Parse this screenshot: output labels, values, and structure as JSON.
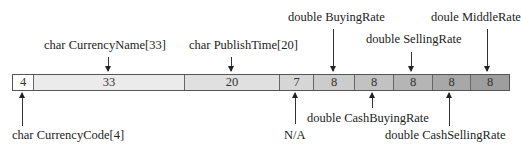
{
  "diagram": {
    "type": "memory-layout",
    "cells": [
      {
        "size": "4",
        "width": 21,
        "color": "#ffffff"
      },
      {
        "size": "33",
        "width": 151,
        "color": "#ebebeb"
      },
      {
        "size": "20",
        "width": 95,
        "color": "#e0e0e0"
      },
      {
        "size": "7",
        "width": 34,
        "color": "#d6d6d6"
      },
      {
        "size": "8",
        "width": 41,
        "color": "#cccccc"
      },
      {
        "size": "8",
        "width": 39,
        "color": "#c2c2c2"
      },
      {
        "size": "8",
        "width": 39,
        "color": "#b5b5b5"
      },
      {
        "size": "8",
        "width": 38,
        "color": "#a8a8a8"
      },
      {
        "size": "8",
        "width": 40,
        "color": "#9e9e9e"
      }
    ],
    "top_labels": [
      {
        "text": "char CurrencyName[33]",
        "target_cell": 1
      },
      {
        "text": "char PublishTime[20]",
        "target_cell": 2
      },
      {
        "text": "double BuyingRate",
        "target_cell": 4
      },
      {
        "text": "double SellingRate",
        "target_cell": 6
      },
      {
        "text": "doule MiddleRate",
        "target_cell": 8
      }
    ],
    "bottom_labels": [
      {
        "text": "char CurrencyCode[4]",
        "target_cell": 0
      },
      {
        "text": "N/A",
        "target_cell": 3
      },
      {
        "text": "double CashBuyingRate",
        "target_cell": 5
      },
      {
        "text": "double CashSellingRate",
        "target_cell": 7
      }
    ]
  }
}
